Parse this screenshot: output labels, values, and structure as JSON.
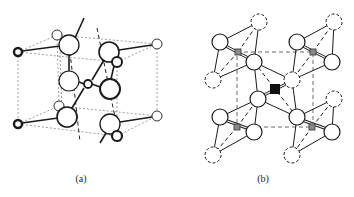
{
  "figure": {
    "panels": [
      {
        "id": "a",
        "caption": "(a)",
        "description": "Crystal structure unit cell with large and small atoms bonded, dashed cell edges"
      },
      {
        "id": "b",
        "caption": "(b)",
        "description": "Octahedral coordination structure with dashed unit cell, gray and black central atoms"
      }
    ]
  },
  "colors": {
    "line": "#1a1a1a",
    "dashed_cell": "#555555",
    "atom_fill": "#ffffff",
    "gray_atom": "#8a8a8a",
    "black_atom": "#111111"
  }
}
